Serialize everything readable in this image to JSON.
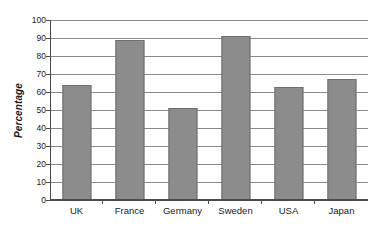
{
  "chart_data": {
    "type": "bar",
    "title": "",
    "subtitle": "",
    "xlabel": "",
    "ylabel": "Percentage",
    "categories": [
      "UK",
      "France",
      "Germany",
      "Sweden",
      "USA",
      "Japan"
    ],
    "values": [
      64,
      89,
      51,
      91,
      63,
      67
    ],
    "ylim": [
      0,
      100
    ],
    "ytick_step": 10,
    "yticks": [
      0,
      10,
      20,
      30,
      40,
      50,
      60,
      70,
      80,
      90,
      100
    ],
    "ytick_labels": [
      "0",
      "10",
      "20",
      "30",
      "40",
      "50",
      "60",
      "70",
      "80",
      "90",
      "100"
    ],
    "grid": true,
    "grid_axis": "y",
    "legend": false,
    "legend_position": "none",
    "series": [
      {
        "name": "Percentage",
        "values": [
          64,
          89,
          51,
          91,
          63,
          67
        ]
      }
    ],
    "colors": {
      "bar_fill": "#8c8c8c",
      "bar_border": "#6f6f6f",
      "gridline": "#8a8a8a",
      "axis": "#4a4a4a",
      "text": "#1a1a1a",
      "background": "#ffffff"
    }
  }
}
